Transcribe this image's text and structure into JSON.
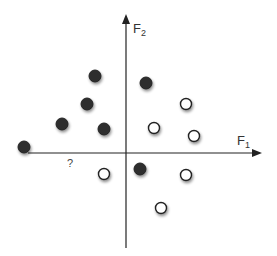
{
  "diagram": {
    "title": "",
    "axes": {
      "x": {
        "label": "F",
        "subscript": "1",
        "origin": [
          126,
          153
        ],
        "from": 28,
        "to": 262
      },
      "y": {
        "label": "F",
        "subscript": "2",
        "origin": [
          126,
          153
        ],
        "from": 248,
        "to": 14
      }
    },
    "query_label": "?",
    "colors": {
      "axis": "#222222",
      "dark_fill": "#2e2e2e",
      "white_fill": "#ffffff",
      "stroke": "#222222",
      "shadow": "#999999"
    },
    "points": {
      "dark": [
        [
          95,
          76
        ],
        [
          87,
          104
        ],
        [
          62,
          124
        ],
        [
          104,
          129
        ],
        [
          24,
          147
        ],
        [
          146,
          83
        ],
        [
          140,
          169
        ]
      ],
      "white": [
        [
          186,
          104
        ],
        [
          154,
          128
        ],
        [
          194,
          136
        ],
        [
          104,
          174
        ],
        [
          186,
          175
        ],
        [
          161,
          208
        ]
      ]
    }
  }
}
